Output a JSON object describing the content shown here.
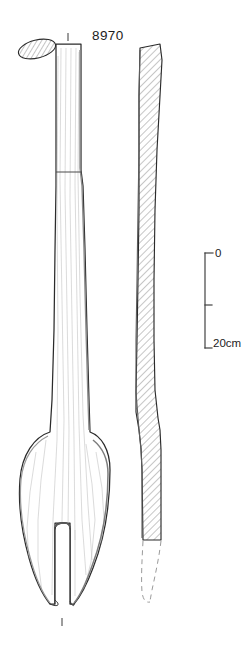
{
  "plate": {
    "title": "8970",
    "background_color": "#ffffff",
    "ink_color": "#2b2b2b",
    "hatch_color": "#6e6e6e",
    "grain_color": "#b9b9b9"
  },
  "catalogue": {
    "number": "8970"
  },
  "scale_bar": {
    "top_label": "0",
    "bottom_label": "20cm",
    "unit": "cm",
    "min_value": 0,
    "max_value": 20,
    "tick_values": [
      0,
      10,
      20
    ],
    "orientation": "vertical",
    "x": 205,
    "y_top": 253,
    "y_bottom": 348,
    "serif_length": 8
  },
  "views": {
    "cross_section": {
      "name": "oval-cross-section",
      "center_x": 37,
      "center_y": 49,
      "radius_x": 19,
      "radius_y": 9,
      "rotation_deg": -14,
      "hatched": true
    },
    "front_view": {
      "name": "front-elevation",
      "top_tick_x": 68,
      "top_tick_y1": 33,
      "top_tick_y2": 41,
      "bottom_tick_x": 62,
      "bottom_tick_y1": 618,
      "bottom_tick_y2": 626,
      "handle_top_y": 44,
      "break_line_y": 172,
      "bowl_top_y": 432,
      "bowl_bottom_y": 607,
      "notch_top_y": 523,
      "notch_bottom_y": 600
    },
    "side_view": {
      "name": "side-profile",
      "top_y": 44,
      "solid_bottom_y": 540,
      "reconstructed_tip_y": 602,
      "hatched": true,
      "reconstruction_style": "dashed"
    }
  },
  "annotations": {
    "reconstruction_note": "dashed outline indicates reconstructed tip"
  }
}
